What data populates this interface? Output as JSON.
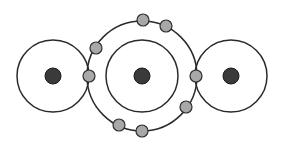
{
  "diagram": {
    "type": "bohr-model-covalent-bonding",
    "colors": {
      "background": "#ffffff",
      "shell_stroke": "#2a2a2a",
      "nucleus_fill": "#3a3a3a",
      "electron_fill": "#a8a8a8",
      "electron_stroke": "#2e2e2e"
    },
    "atoms": [
      {
        "name": "left-atom",
        "nucleus": {
          "cx": 53,
          "cy": 76,
          "r": 8
        },
        "shells": [
          {
            "r": 36
          }
        ]
      },
      {
        "name": "center-atom",
        "nucleus": {
          "cx": 142,
          "cy": 76,
          "r": 8
        },
        "shells": [
          {
            "r": 36
          },
          {
            "r": 55
          }
        ]
      },
      {
        "name": "right-atom",
        "nucleus": {
          "cx": 231,
          "cy": 76,
          "r": 8
        },
        "shells": [
          {
            "r": 36
          }
        ]
      }
    ],
    "electrons": [
      {
        "cx": 89,
        "cy": 76
      },
      {
        "cx": 96,
        "cy": 48
      },
      {
        "cx": 143,
        "cy": 20
      },
      {
        "cx": 166,
        "cy": 26
      },
      {
        "cx": 196,
        "cy": 76
      },
      {
        "cx": 186,
        "cy": 107
      },
      {
        "cx": 142,
        "cy": 131
      },
      {
        "cx": 119,
        "cy": 125
      }
    ],
    "electron_radius": 6
  }
}
